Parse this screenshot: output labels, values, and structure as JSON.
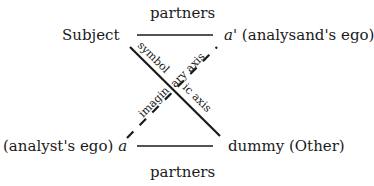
{
  "diagram": {
    "type": "schema-L",
    "nodes": {
      "subject": {
        "label": "Subject"
      },
      "a_prime": {
        "symbol": "a'",
        "description": "(analysand's ego)"
      },
      "a": {
        "symbol": "a",
        "description": "(analyst's ego)"
      },
      "dummy": {
        "label": "dummy (Other)"
      }
    },
    "edges": {
      "top": {
        "label": "partners",
        "style": "solid"
      },
      "bottom": {
        "label": "partners",
        "style": "solid"
      },
      "symbolic": {
        "label_part1": "symbol",
        "label_part2": "ic axis",
        "style": "solid"
      },
      "imaginary": {
        "label_part1": "imagin",
        "label_part2": "ary axis",
        "style": "dashed"
      }
    }
  }
}
